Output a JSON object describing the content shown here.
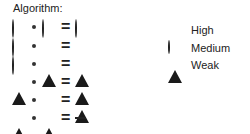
{
  "title": "Algorithm:",
  "symbols": {
    "high": "filled-circle",
    "medium": "open-circle",
    "weak": "filled-triangle",
    "none": "dash"
  },
  "rules": [
    {
      "a": "medium",
      "b": "medium",
      "result": "medium"
    },
    {
      "a": "medium",
      "b": "high",
      "result": "high"
    },
    {
      "a": "medium",
      "b": "weak",
      "result": "weak"
    },
    {
      "a": "weak",
      "b": "high",
      "result": "weak"
    },
    {
      "a": "high",
      "b": "high",
      "result": "weak"
    },
    {
      "a": "weak",
      "b": "weak",
      "result": "none"
    }
  ],
  "operators": {
    "multiply": "·",
    "equals": "="
  },
  "legend": [
    {
      "symbol": "high",
      "label": "High",
      "value": "9"
    },
    {
      "symbol": "medium",
      "label": "Medium",
      "value": "3"
    },
    {
      "symbol": "weak",
      "label": "Weak",
      "value": "1"
    }
  ],
  "colors": {
    "ink": "#1a1a1a",
    "background": "#ffffff"
  }
}
